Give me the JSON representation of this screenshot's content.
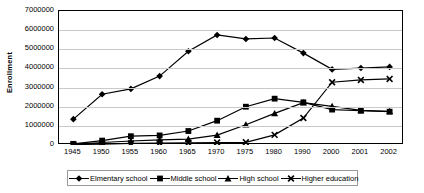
{
  "chart_data": {
    "type": "line",
    "title": "",
    "xlabel": "",
    "ylabel": "Enrollment",
    "categories": [
      "1945",
      "1950",
      "1955",
      "1960",
      "1965",
      "1970",
      "1975",
      "1980",
      "1990",
      "2000",
      "2001",
      "2002"
    ],
    "ylim": [
      0,
      7000000
    ],
    "ytick_labels": [
      "7000000",
      "6000000",
      "5000000",
      "4000000",
      "3000000",
      "2000000",
      "1000000",
      "0"
    ],
    "ytick_values": [
      7000000,
      6000000,
      5000000,
      4000000,
      3000000,
      2000000,
      1000000,
      0
    ],
    "grid": true,
    "legend_position": "bottom",
    "series": [
      {
        "name": "Elmentary school",
        "marker": "diamond",
        "color": "#000000",
        "values": [
          1350000,
          2650000,
          2930000,
          3600000,
          4900000,
          5750000,
          5540000,
          5590000,
          4800000,
          3950000,
          4020000,
          4080000
        ]
      },
      {
        "name": "Middle school",
        "marker": "square",
        "color": "#000000",
        "values": [
          60000,
          230000,
          460000,
          500000,
          730000,
          1270000,
          2000000,
          2420000,
          2230000,
          1850000,
          1790000,
          1740000
        ]
      },
      {
        "name": "High school",
        "marker": "triangle",
        "color": "#000000",
        "values": [
          40000,
          130000,
          210000,
          270000,
          310000,
          520000,
          1060000,
          1650000,
          2210000,
          2020000,
          1810000,
          1760000
        ]
      },
      {
        "name": "Higher education",
        "marker": "cross",
        "color": "#000000",
        "values": [
          20000,
          50000,
          80000,
          100000,
          110000,
          130000,
          140000,
          530000,
          1410000,
          3280000,
          3400000,
          3450000
        ]
      }
    ]
  },
  "legend": {
    "items": [
      {
        "label": "Elmentary school",
        "marker": "diamond"
      },
      {
        "label": "Middle school",
        "marker": "square"
      },
      {
        "label": "High school",
        "marker": "triangle"
      },
      {
        "label": "Higher education",
        "marker": "cross"
      }
    ]
  }
}
